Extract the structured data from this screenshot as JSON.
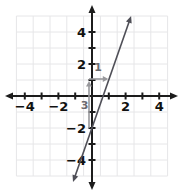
{
  "chart_data": {
    "type": "line",
    "title": "",
    "line": {
      "slope": 3,
      "y_intercept": -2,
      "x_intercept": 0.67,
      "endpoints": [
        [
          -1.13,
          -5.38
        ],
        [
          2.33,
          5.0
        ]
      ],
      "arrowheads": "both"
    },
    "x_axis": {
      "range": [
        -5,
        5
      ],
      "ticks": [
        -4,
        -3,
        -2,
        -1,
        1,
        2,
        3,
        4
      ],
      "labels": [
        {
          "value": -4,
          "text": "−4"
        },
        {
          "value": -2,
          "text": "−2"
        },
        {
          "value": 2,
          "text": "2"
        },
        {
          "value": 4,
          "text": "4"
        }
      ]
    },
    "y_axis": {
      "range": [
        -5,
        5
      ],
      "ticks": [
        -4,
        -3,
        -2,
        -1,
        1,
        2,
        3,
        4
      ],
      "labels": [
        {
          "value": 4,
          "text": "4"
        },
        {
          "value": 2,
          "text": "2"
        },
        {
          "value": -2,
          "text": "−2"
        },
        {
          "value": -4,
          "text": "−4"
        }
      ]
    },
    "grid": true,
    "annotations": [
      {
        "name": "rise",
        "text": "3",
        "from": [
          0,
          -2
        ],
        "to": [
          0,
          1
        ]
      },
      {
        "name": "run",
        "text": "1",
        "from": [
          0,
          1
        ],
        "to": [
          1,
          1
        ]
      }
    ],
    "colors": {
      "background": "#ffffff",
      "grid": "#e6e6e8",
      "axis": "#1c1c1c",
      "label_text": "#111111",
      "line": "#4f4f57",
      "annotation_arrow": "#98989c",
      "annotation_text": "#6b6b70"
    }
  }
}
